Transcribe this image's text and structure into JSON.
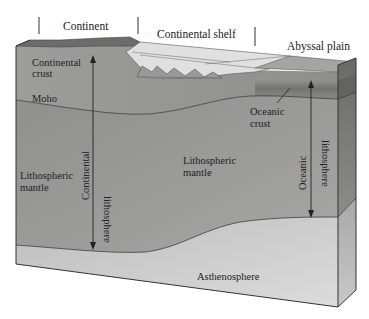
{
  "figure": {
    "type": "block-diagram"
  },
  "header_labels": {
    "continent": "Continent",
    "continental_shelf": "Continental shelf",
    "abyssal_plain": "Abyssal plain"
  },
  "layer_labels": {
    "continental_crust_line1": "Continental",
    "continental_crust_line2": "crust",
    "moho": "Moho",
    "oceanic_crust_line1": "Oceanic",
    "oceanic_crust_line2": "crust",
    "lithospheric_mantle_left_line1": "Lithospheric",
    "lithospheric_mantle_left_line2": "mantle",
    "lithospheric_mantle_center_line1": "Lithospheric",
    "lithospheric_mantle_center_line2": "mantle",
    "asthenosphere": "Asthenosphere"
  },
  "thickness_arrows": {
    "continental_line1": "Continental",
    "continental_line2": "lithosphere",
    "oceanic_line1": "Oceanic",
    "oceanic_line2": "lithosphere"
  },
  "colors": {
    "crust": "#9a9a98",
    "continent_surface": "#6e6c68",
    "shelf_sediment": "#dcdcdc",
    "lithospheric_mantle": "#8a8a88",
    "asthenosphere": "#c4c4c4",
    "oceanic_crust": "#7a7a78",
    "outline": "#333333",
    "text": "#222222"
  }
}
